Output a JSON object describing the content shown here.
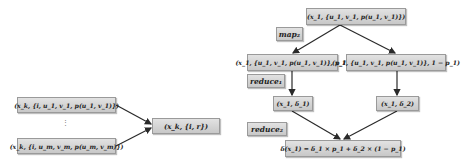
{
  "left_diagram": {
    "input_top": "(x_k, {i, u_1, v_1, p(u_1, v_1)})",
    "input_bottom": "(x_k, {i, u_m, v_m, p(u_m, v_m)})",
    "ellipsis": "⋮",
    "output": "(x_k, {i, r})"
  },
  "right_diagram": {
    "root": "(x_1, {u_1, v_1, p(u_1, v_1)})",
    "map_label": "map₂",
    "branch_left": "(x_1, {u_1, v_1, p(u_1, v_1)}, p_1)",
    "branch_right": "(x_1, {u_1, v_1, p(u_1, v_1)}, 1 − p_1)",
    "reduce1_label": "reduce₁",
    "delta1": "(x_1, δ_1)",
    "delta2": "(x_1, δ_2)",
    "reduce2_label": "reduce₂",
    "result": "δ(x_1) = δ_1 × p_1 + δ_2 × (1 − p_1)"
  },
  "colors": {
    "box_fill": "#d4d4d4",
    "box_border": "#9a9a9a",
    "arrow": "#2a2a2a"
  }
}
